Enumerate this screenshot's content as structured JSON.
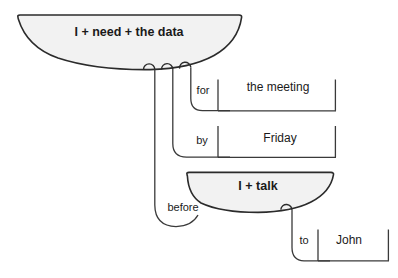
{
  "diagram": {
    "type": "dependency-clause-diagram",
    "background_color": "#ffffff",
    "bowl_fill_color": "#f2f2f2",
    "stroke_color": "#2b2b2b",
    "main_clause": {
      "label": "I + need + the data"
    },
    "embedded_clause": {
      "label": "I + talk"
    },
    "adjuncts": [
      {
        "relator": "for",
        "filler": "the meeting"
      },
      {
        "relator": "by",
        "filler": "Friday"
      },
      {
        "relator": "before",
        "filler": ""
      },
      {
        "relator": "to",
        "filler": "John"
      }
    ],
    "relators": {
      "for": "for",
      "by": "by",
      "before": "before",
      "to": "to"
    },
    "fillers": {
      "the_meeting": "the meeting",
      "friday": "Friday",
      "john": "John"
    }
  }
}
